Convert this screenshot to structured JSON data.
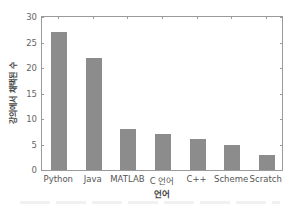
{
  "chart_data": {
    "type": "bar",
    "title": "",
    "xlabel": "언어",
    "ylabel": "강의에서 채택된 수",
    "categories": [
      "Python",
      "Java",
      "MATLAB",
      "C 언어",
      "C++",
      "Scheme",
      "Scratch"
    ],
    "values": [
      27,
      22,
      8,
      7,
      6,
      5,
      3
    ],
    "ylim": [
      0,
      30
    ],
    "yticks": [
      0,
      5,
      10,
      15,
      20,
      25,
      30
    ],
    "grid": false,
    "legend": null,
    "bar_color": "#8c8c8c"
  }
}
